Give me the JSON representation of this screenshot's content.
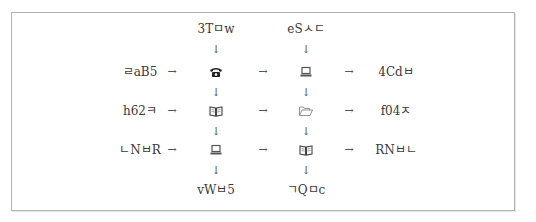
{
  "diagram": {
    "top_labels": [
      "3Tㅁw",
      "eSㅅㄷ"
    ],
    "bottom_labels": [
      "vWㅂ5",
      "ㄱQㅁc"
    ],
    "left_labels": [
      "ㄹaB5",
      "h62ㅋ",
      "ㄴNㅂR"
    ],
    "right_labels": [
      "4Cdㅂ",
      "f04ㅈ",
      "RNㅂㄴ"
    ],
    "grid_icons": [
      [
        "telephone-icon",
        "laptop-icon"
      ],
      [
        "open-book-icon",
        "open-folder-icon"
      ],
      [
        "laptop-icon",
        "open-book-icon"
      ]
    ],
    "arrow_right": "→",
    "arrow_down": "↓"
  }
}
